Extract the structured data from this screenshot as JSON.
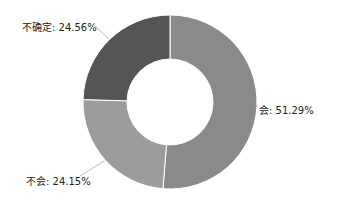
{
  "chart_data": {
    "type": "pie",
    "variant": "donut",
    "title": "",
    "categories": [
      "会",
      "不会",
      "不确定"
    ],
    "values": [
      51.29,
      24.15,
      24.56
    ],
    "unit": "%",
    "colors": [
      "#8a8a8a",
      "#9c9c9c",
      "#555555"
    ],
    "labels": [
      "会: 51.29%",
      "不会: 24.15%",
      "不确定: 24.56%"
    ],
    "legend": "none",
    "start_angle_deg": 0,
    "direction": "clockwise"
  },
  "labels": {
    "hui": "会: 51.29%",
    "buhui": "不会: 24.15%",
    "buqueding": "不确定: 24.56%"
  }
}
